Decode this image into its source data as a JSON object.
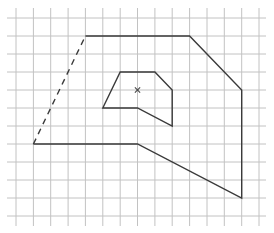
{
  "diagram": {
    "type": "grid-geometry",
    "grid": {
      "columns": 14,
      "rows": 11,
      "x_lines": [
        16,
        33.4,
        50.7,
        68.1,
        85.4,
        102.8,
        120.2,
        137.5,
        154.9,
        172.2,
        189.6,
        207,
        224.3,
        241.7,
        259
      ],
      "y_lines": [
        18,
        36,
        54,
        72,
        90,
        108,
        126,
        144,
        162,
        180,
        198,
        216
      ],
      "x_extent": [
        7,
        266
      ],
      "y_extent": [
        8,
        226
      ],
      "color": "#c2c2c2"
    },
    "outer_shape": {
      "grid_vertices": [
        [
          4,
          1
        ],
        [
          10,
          1
        ],
        [
          13,
          4
        ],
        [
          13,
          10
        ],
        [
          7,
          7
        ],
        [
          1,
          7
        ]
      ],
      "dashed_edge": {
        "from": [
          1,
          7
        ],
        "to": [
          4,
          1
        ]
      },
      "color": "#3a3a3a"
    },
    "inner_shape": {
      "grid_vertices": [
        [
          6,
          3
        ],
        [
          8,
          3
        ],
        [
          9,
          4
        ],
        [
          9,
          6
        ],
        [
          7,
          5
        ],
        [
          5,
          5
        ]
      ],
      "color": "#3a3a3a"
    },
    "center_marker": {
      "symbol": "×",
      "grid_position": [
        7,
        4
      ]
    }
  }
}
